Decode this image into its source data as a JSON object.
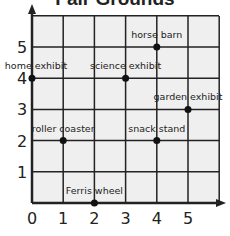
{
  "title": "Fair Grounds",
  "axes": {
    "x_ticks": [
      "0",
      "1",
      "2",
      "3",
      "4",
      "5"
    ],
    "y_ticks": [
      "1",
      "2",
      "3",
      "4",
      "5"
    ]
  },
  "points": [
    {
      "label": "horse barn",
      "x": 4,
      "y": 5
    },
    {
      "label": "home exhibit",
      "x": 0,
      "y": 4
    },
    {
      "label": "science exhibit",
      "x": 3,
      "y": 4
    },
    {
      "label": "garden exhibit",
      "x": 5,
      "y": 3
    },
    {
      "label": "roller coaster",
      "x": 1,
      "y": 2
    },
    {
      "label": "snack stand",
      "x": 4,
      "y": 2
    },
    {
      "label": "Ferris wheel",
      "x": 2,
      "y": 0
    }
  ],
  "colors": {
    "grid_fill": "#efefef",
    "line": "#222222"
  }
}
